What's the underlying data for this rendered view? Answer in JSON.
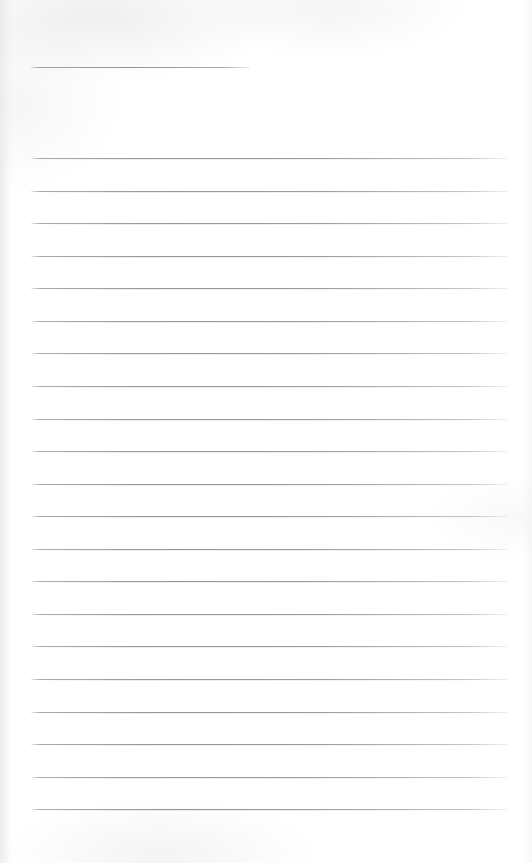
{
  "document": {
    "type": "lined-note-page",
    "title_text": "",
    "body_text": "",
    "page_background_color": "#ffffff",
    "rule_color": "#8d8d91",
    "is_blank": true
  },
  "header_rule": {
    "name": "title-rule",
    "x": 31,
    "y": 67,
    "width": 219
  },
  "layout": {
    "page_width": 532,
    "page_height": 863,
    "line_left": 31,
    "line_right": 508,
    "line_width": 477,
    "first_line_y": 158,
    "line_spacing": 32.6,
    "line_count": 21
  },
  "ruled_lines": [
    {
      "index": 1,
      "y": 158,
      "content": ""
    },
    {
      "index": 2,
      "y": 191,
      "content": ""
    },
    {
      "index": 3,
      "y": 223,
      "content": ""
    },
    {
      "index": 4,
      "y": 256,
      "content": ""
    },
    {
      "index": 5,
      "y": 288,
      "content": ""
    },
    {
      "index": 6,
      "y": 321,
      "content": ""
    },
    {
      "index": 7,
      "y": 353,
      "content": ""
    },
    {
      "index": 8,
      "y": 386,
      "content": ""
    },
    {
      "index": 9,
      "y": 419,
      "content": ""
    },
    {
      "index": 10,
      "y": 451,
      "content": ""
    },
    {
      "index": 11,
      "y": 484,
      "content": ""
    },
    {
      "index": 12,
      "y": 516,
      "content": ""
    },
    {
      "index": 13,
      "y": 549,
      "content": ""
    },
    {
      "index": 14,
      "y": 581,
      "content": ""
    },
    {
      "index": 15,
      "y": 614,
      "content": ""
    },
    {
      "index": 16,
      "y": 646,
      "content": ""
    },
    {
      "index": 17,
      "y": 679,
      "content": ""
    },
    {
      "index": 18,
      "y": 712,
      "content": ""
    },
    {
      "index": 19,
      "y": 744,
      "content": ""
    },
    {
      "index": 20,
      "y": 777,
      "content": ""
    },
    {
      "index": 21,
      "y": 809,
      "content": ""
    }
  ]
}
